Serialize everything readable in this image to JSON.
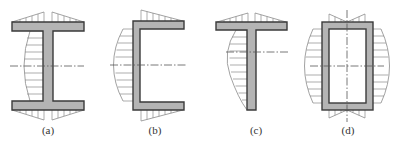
{
  "figure": {
    "colors": {
      "section_fill": "#b4b4b4",
      "section_stroke": "#3a3a3a",
      "hatch": "#8a8a8a",
      "axis": "#555555",
      "label": "#333333"
    },
    "panels": [
      {
        "id": "a",
        "label": "(a)",
        "section": "I-section",
        "label_x": 48
      },
      {
        "id": "b",
        "label": "(b)",
        "section": "channel-section",
        "label_x": 155
      },
      {
        "id": "c",
        "label": "(c)",
        "section": "T-section",
        "label_x": 256
      },
      {
        "id": "d",
        "label": "(d)",
        "section": "box-section",
        "label_x": 348
      }
    ]
  }
}
